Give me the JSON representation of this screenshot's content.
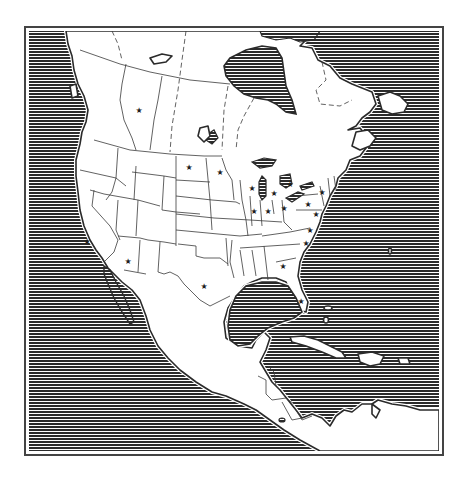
{
  "map": {
    "title": "North America outline map",
    "style": "black-and-white line art with horizontally hatched ocean",
    "colors": {
      "ocean_stripe_dark": "#2b2b2b",
      "ocean_stripe_light": "#ffffff",
      "land": "#ffffff",
      "outline": "#2a2a2a",
      "frame": "#444444"
    },
    "frame": {
      "x": 25,
      "y": 27,
      "width": 418,
      "height": 428
    },
    "hatch": {
      "orientation": "horizontal",
      "pitch_px": 3
    },
    "regions": [
      "Canada",
      "United States",
      "Mexico",
      "Central America",
      "Caribbean",
      "Greenland (partial)"
    ],
    "water_bodies": [
      "Pacific Ocean",
      "Atlantic Ocean",
      "Gulf of Mexico",
      "Hudson Bay",
      "Caribbean Sea",
      "Gulf of California",
      "Great Lakes"
    ],
    "capital_marker_icon": "star-icon",
    "capital_marker_glyph": "★",
    "capital_markers": [
      {
        "id": "alberta",
        "x": 139,
        "y": 110
      },
      {
        "id": "north-dakota",
        "x": 189,
        "y": 167
      },
      {
        "id": "minnesota",
        "x": 220,
        "y": 172
      },
      {
        "id": "michigan",
        "x": 253,
        "y": 188
      },
      {
        "id": "wisconsin",
        "x": 252,
        "y": 188
      },
      {
        "id": "ontario",
        "x": 290,
        "y": 184
      },
      {
        "id": "new-york",
        "x": 322,
        "y": 192
      },
      {
        "id": "illinois",
        "x": 254,
        "y": 211
      },
      {
        "id": "indiana",
        "x": 268,
        "y": 211
      },
      {
        "id": "ohio",
        "x": 284,
        "y": 208
      },
      {
        "id": "pennsylvania",
        "x": 308,
        "y": 204
      },
      {
        "id": "michigan-south",
        "x": 274,
        "y": 193
      },
      {
        "id": "maryland",
        "x": 316,
        "y": 214
      },
      {
        "id": "virginia",
        "x": 310,
        "y": 230
      },
      {
        "id": "north-carolina",
        "x": 306,
        "y": 243
      },
      {
        "id": "georgia",
        "x": 283,
        "y": 266
      },
      {
        "id": "florida",
        "x": 301,
        "y": 301
      },
      {
        "id": "california",
        "x": 87,
        "y": 241
      },
      {
        "id": "arizona",
        "x": 128,
        "y": 261
      },
      {
        "id": "texas",
        "x": 204,
        "y": 286
      }
    ]
  }
}
